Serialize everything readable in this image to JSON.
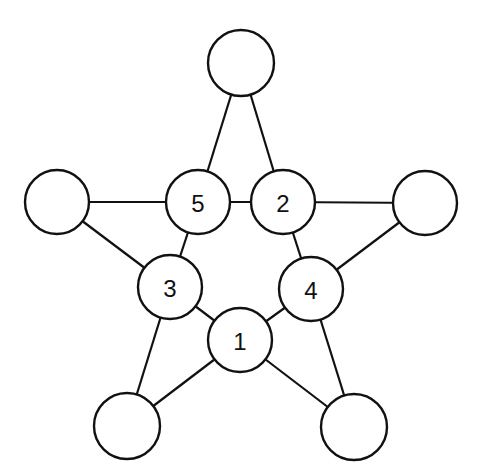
{
  "diagram": {
    "title": "",
    "nodes": [
      {
        "id": "top",
        "label": "",
        "x": 241,
        "y": 63,
        "r": 33
      },
      {
        "id": "n5",
        "label": "5",
        "x": 198,
        "y": 202,
        "r": 32
      },
      {
        "id": "n2",
        "label": "2",
        "x": 283,
        "y": 202,
        "r": 32
      },
      {
        "id": "left",
        "label": "",
        "x": 57,
        "y": 202,
        "r": 32
      },
      {
        "id": "right",
        "label": "",
        "x": 425,
        "y": 203,
        "r": 32
      },
      {
        "id": "n3",
        "label": "3",
        "x": 170,
        "y": 287,
        "r": 32
      },
      {
        "id": "n4",
        "label": "4",
        "x": 311,
        "y": 289,
        "r": 32
      },
      {
        "id": "n1",
        "label": "1",
        "x": 240,
        "y": 340,
        "r": 32
      },
      {
        "id": "bl",
        "label": "",
        "x": 127,
        "y": 426,
        "r": 33
      },
      {
        "id": "br",
        "label": "",
        "x": 354,
        "y": 427,
        "r": 33
      }
    ],
    "edges": [
      [
        "top",
        "n5"
      ],
      [
        "top",
        "n2"
      ],
      [
        "left",
        "n5"
      ],
      [
        "n5",
        "n2"
      ],
      [
        "n2",
        "right"
      ],
      [
        "left",
        "n3"
      ],
      [
        "right",
        "n4"
      ],
      [
        "n5",
        "n3"
      ],
      [
        "n2",
        "n4"
      ],
      [
        "n3",
        "n1"
      ],
      [
        "n4",
        "n1"
      ],
      [
        "n3",
        "bl"
      ],
      [
        "n1",
        "bl"
      ],
      [
        "n4",
        "br"
      ],
      [
        "n1",
        "br"
      ]
    ]
  }
}
